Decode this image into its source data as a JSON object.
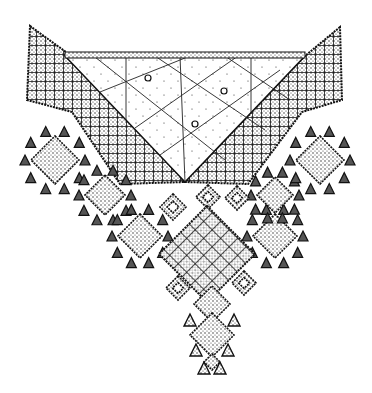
{
  "image": {
    "description": "Black and white ink drawing of a geometric embroidered textile pendant",
    "width": 372,
    "height": 393,
    "background": "#ffffff",
    "ink": "#111111",
    "stipple_fill": "#bdbdbd"
  },
  "motifs": {
    "top_band": {
      "x1": 65,
      "x2": 305,
      "y": 52,
      "height": 6
    },
    "center_panel": {
      "points": [
        [
          65,
          56
        ],
        [
          305,
          56
        ],
        [
          185,
          182
        ]
      ],
      "circles": [
        [
          148,
          78
        ],
        [
          224,
          91
        ],
        [
          195,
          124
        ]
      ]
    },
    "left_wing": {
      "points": [
        [
          30,
          26
        ],
        [
          66,
          52
        ],
        [
          185,
          182
        ],
        [
          120,
          184
        ],
        [
          72,
          112
        ],
        [
          27,
          100
        ]
      ]
    },
    "right_wing": {
      "points": [
        [
          340,
          27
        ],
        [
          305,
          56
        ],
        [
          185,
          182
        ],
        [
          248,
          184
        ],
        [
          302,
          112
        ],
        [
          342,
          100
        ]
      ]
    },
    "central_diamond": {
      "cx": 207,
      "cy": 254,
      "r": 48
    },
    "small_diamonds": [
      {
        "cx": 173,
        "cy": 207,
        "r": 13
      },
      {
        "cx": 237,
        "cy": 198,
        "r": 12
      },
      {
        "cx": 178,
        "cy": 288,
        "r": 12
      },
      {
        "cx": 244,
        "cy": 283,
        "r": 12
      },
      {
        "cx": 208,
        "cy": 197,
        "r": 12
      }
    ],
    "pendant": [
      {
        "cx": 212,
        "cy": 304,
        "r": 18
      },
      {
        "cx": 212,
        "cy": 335,
        "r": 22
      },
      {
        "cx": 212,
        "cy": 362,
        "r": 8
      }
    ],
    "side_clusters": [
      {
        "cx": 55,
        "cy": 160,
        "r": 24
      },
      {
        "cx": 105,
        "cy": 195,
        "r": 20
      },
      {
        "cx": 140,
        "cy": 236,
        "r": 22
      },
      {
        "cx": 275,
        "cy": 236,
        "r": 22
      },
      {
        "cx": 275,
        "cy": 195,
        "r": 18
      },
      {
        "cx": 320,
        "cy": 160,
        "r": 24
      }
    ]
  }
}
